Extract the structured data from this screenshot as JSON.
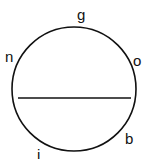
{
  "diagram": {
    "type": "circle-with-chord",
    "labels": {
      "top": "g",
      "upper_left": "n",
      "upper_right": "o",
      "lower_right": "b",
      "bottom_left": "i"
    },
    "stroke_color": "#111111",
    "background_color": "#ffffff"
  }
}
